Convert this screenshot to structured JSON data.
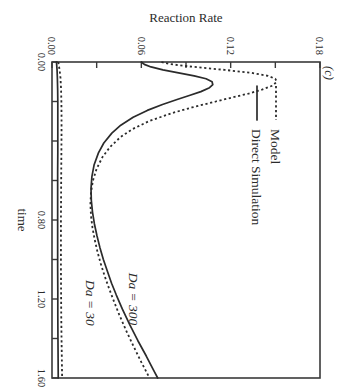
{
  "figure": {
    "panel_label": "(c)",
    "background_color": "#ffffff",
    "ink_color": "#2b2b2b",
    "rotation_degrees": 90
  },
  "legend": {
    "position": "upper-left",
    "entries": [
      {
        "label": "Model",
        "style": "dotted"
      },
      {
        "label": "Direct Simulation",
        "style": "solid"
      }
    ]
  },
  "annotations": [
    {
      "text": "Da = 300",
      "x": 1.2,
      "y": 0.052
    },
    {
      "text": "Da = 30",
      "x": 1.22,
      "y": 0.0225
    }
  ],
  "chart_data": {
    "type": "line",
    "title": "(c)",
    "xlabel": "time",
    "ylabel": "Reaction Rate",
    "xlim": [
      0.0,
      1.6
    ],
    "ylim": [
      0.0,
      0.18
    ],
    "xticks": [
      0.0,
      0.2,
      0.4,
      0.6,
      0.8,
      1.0,
      1.2,
      1.4,
      1.6
    ],
    "xtick_labels": [
      "0.00",
      "",
      "",
      "",
      "0.80",
      "",
      "1.20",
      "",
      "1.60"
    ],
    "yticks": [
      0.0,
      0.03,
      0.06,
      0.09,
      0.12,
      0.15,
      0.18
    ],
    "ytick_labels": [
      "0.00",
      "",
      "0.06",
      "",
      "0.12",
      "",
      "0.18"
    ],
    "grid": false,
    "legend_position": "upper left",
    "series": [
      {
        "name": "Da = 300 (Model)",
        "style": "dotted",
        "group": "Da = 300",
        "x": [
          0.0,
          0.01,
          0.02,
          0.03,
          0.04,
          0.055,
          0.07,
          0.085,
          0.1,
          0.12,
          0.14,
          0.16,
          0.18,
          0.2,
          0.23,
          0.26,
          0.3,
          0.34,
          0.38,
          0.43,
          0.48,
          0.54,
          0.6,
          0.66,
          0.72,
          0.78,
          0.84,
          0.9,
          0.96,
          1.02,
          1.08,
          1.14,
          1.2,
          1.28,
          1.36,
          1.44,
          1.52,
          1.6
        ],
        "y": [
          0.0735,
          0.079,
          0.089,
          0.102,
          0.116,
          0.134,
          0.145,
          0.15,
          0.151,
          0.148,
          0.141,
          0.132,
          0.121,
          0.11,
          0.094,
          0.08,
          0.065,
          0.054,
          0.046,
          0.039,
          0.034,
          0.03,
          0.0275,
          0.0262,
          0.0258,
          0.0262,
          0.0272,
          0.0287,
          0.0305,
          0.0327,
          0.0352,
          0.038,
          0.041,
          0.0452,
          0.0498,
          0.0548,
          0.06,
          0.0655
        ]
      },
      {
        "name": "Da = 300 (Direct Simulation)",
        "style": "solid",
        "group": "Da = 300",
        "x": [
          0.0,
          0.012,
          0.025,
          0.04,
          0.055,
          0.07,
          0.085,
          0.1,
          0.115,
          0.13,
          0.15,
          0.17,
          0.19,
          0.215,
          0.245,
          0.28,
          0.32,
          0.36,
          0.41,
          0.46,
          0.52,
          0.58,
          0.64,
          0.7,
          0.76,
          0.82,
          0.88,
          0.94,
          1.0,
          1.06,
          1.12,
          1.18,
          1.25,
          1.33,
          1.41,
          1.49,
          1.56,
          1.6
        ],
        "y": [
          0.06,
          0.062,
          0.0665,
          0.0745,
          0.085,
          0.0955,
          0.1035,
          0.1075,
          0.108,
          0.1058,
          0.1,
          0.0922,
          0.084,
          0.0742,
          0.064,
          0.0545,
          0.0462,
          0.0402,
          0.0348,
          0.0312,
          0.0283,
          0.0268,
          0.0262,
          0.0264,
          0.0272,
          0.0285,
          0.0302,
          0.0322,
          0.0345,
          0.0372,
          0.04,
          0.0432,
          0.0472,
          0.0522,
          0.0576,
          0.0634,
          0.0682,
          0.071
        ]
      },
      {
        "name": "Da = 30 (Model)",
        "style": "dotted",
        "group": "Da = 30",
        "x": [
          0.0,
          0.04,
          0.08,
          0.14,
          0.2,
          0.28,
          0.36,
          0.46,
          0.56,
          0.68,
          0.8,
          0.92,
          1.04,
          1.16,
          1.28,
          1.4,
          1.5,
          1.6
        ],
        "y": [
          0.0042,
          0.0051,
          0.0057,
          0.0061,
          0.0063,
          0.0064,
          0.0064,
          0.0063,
          0.0062,
          0.0061,
          0.006,
          0.006,
          0.006,
          0.0061,
          0.0062,
          0.0064,
          0.0066,
          0.0068
        ]
      },
      {
        "name": "Da = 30 (Direct Simulation)",
        "style": "solid",
        "group": "Da = 30",
        "x": [
          0.0,
          0.04,
          0.08,
          0.14,
          0.2,
          0.28,
          0.36,
          0.46,
          0.56,
          0.68,
          0.8,
          0.92,
          1.04,
          1.16,
          1.28,
          1.4,
          1.5,
          1.6
        ],
        "y": [
          0.003,
          0.0034,
          0.0036,
          0.0038,
          0.0039,
          0.0039,
          0.0039,
          0.0039,
          0.0038,
          0.0038,
          0.0038,
          0.0038,
          0.0038,
          0.0039,
          0.0039,
          0.004,
          0.0041,
          0.0042
        ]
      }
    ]
  }
}
